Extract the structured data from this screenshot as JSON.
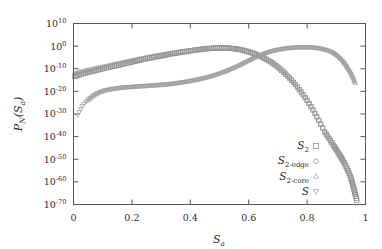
{
  "figure": {
    "background_color": "#ffffff",
    "frame_color": "#555555"
  },
  "chart_data": {
    "type": "scatter",
    "title": "",
    "xlabel": "S_a",
    "ylabel": "P_N(S_a)",
    "xlabel_base": "S",
    "xlabel_sub": "a",
    "ylabel_parts": {
      "p": "P",
      "n": "N",
      "open": "(",
      "s": "S",
      "a": "a",
      "close": ")"
    },
    "xlim": [
      0,
      1
    ],
    "ylim_log10": [
      -70,
      10
    ],
    "yscale": "log",
    "grid": false,
    "xticks": [
      0,
      0.2,
      0.4,
      0.6,
      0.8,
      1
    ],
    "xticklabels": [
      "0",
      "0.2",
      "0.4",
      "0.6",
      "0.8",
      "1"
    ],
    "yticks_log10": [
      10,
      0,
      -10,
      -20,
      -30,
      -40,
      -50,
      -60,
      -70
    ],
    "yticklabels": [
      "10^10",
      "10^0",
      "10^-10",
      "10^-20",
      "10^-30",
      "10^-40",
      "10^-50",
      "10^-60",
      "10^-70"
    ],
    "ytick_mantissa": "10",
    "ytick_exponents": [
      "10",
      "0",
      "-10",
      "-20",
      "-30",
      "-40",
      "-50",
      "-60",
      "-70"
    ],
    "legend_position": "lower-right-inside",
    "series": [
      {
        "name": "S_2",
        "legend_base": "S",
        "legend_sub": "2",
        "marker": "square",
        "color": "#8c8c8c",
        "x": [
          0.005,
          0.02,
          0.04,
          0.06,
          0.08,
          0.1,
          0.12,
          0.14,
          0.16,
          0.18,
          0.2,
          0.22,
          0.24,
          0.26,
          0.28,
          0.3,
          0.32,
          0.34,
          0.36,
          0.38,
          0.4,
          0.42,
          0.44,
          0.46,
          0.48,
          0.5,
          0.52,
          0.54,
          0.56,
          0.58,
          0.6,
          0.62,
          0.64,
          0.66,
          0.68,
          0.7,
          0.72,
          0.74,
          0.76,
          0.78,
          0.8,
          0.82,
          0.84,
          0.86,
          0.875,
          0.89,
          0.9,
          0.91,
          0.92,
          0.93,
          0.94,
          0.95,
          0.955,
          0.96,
          0.965,
          0.97
        ],
        "y_log10": [
          -13.4,
          -12.6,
          -11.9,
          -11.2,
          -10.6,
          -10.0,
          -9.4,
          -8.8,
          -8.2,
          -7.6,
          -7.0,
          -6.4,
          -5.8,
          -5.3,
          -4.8,
          -4.3,
          -3.8,
          -3.3,
          -2.9,
          -2.5,
          -2.1,
          -1.7,
          -1.4,
          -1.1,
          -0.9,
          -0.8,
          -0.8,
          -1.0,
          -1.3,
          -1.8,
          -2.5,
          -3.4,
          -4.5,
          -5.8,
          -7.4,
          -9.3,
          -11.5,
          -14.1,
          -17.0,
          -20.3,
          -24.0,
          -28.2,
          -32.8,
          -37.9,
          -40.8,
          -43.8,
          -45.8,
          -47.9,
          -50.0,
          -52.3,
          -55.0,
          -58.2,
          -60.5,
          -63.0,
          -65.5,
          -68.2
        ]
      },
      {
        "name": "S_2-edge",
        "legend_base": "S",
        "legend_sub": "2-edge",
        "marker": "circle",
        "color": "#9a9a9a",
        "x": [
          0.005,
          0.02,
          0.04,
          0.06,
          0.08,
          0.1,
          0.12,
          0.14,
          0.16,
          0.18,
          0.2,
          0.22,
          0.24,
          0.26,
          0.28,
          0.3,
          0.32,
          0.34,
          0.36,
          0.38,
          0.4,
          0.42,
          0.44,
          0.46,
          0.48,
          0.5,
          0.52,
          0.54,
          0.56,
          0.58,
          0.6,
          0.62,
          0.64,
          0.66,
          0.68,
          0.7,
          0.72,
          0.74,
          0.76,
          0.78,
          0.8,
          0.82,
          0.84,
          0.86,
          0.875,
          0.89,
          0.9,
          0.91,
          0.92,
          0.93,
          0.94,
          0.95,
          0.955,
          0.96,
          0.965
        ],
        "y_log10": [
          -12.2,
          -11.5,
          -10.9,
          -10.3,
          -9.7,
          -9.2,
          -8.6,
          -8.0,
          -7.5,
          -6.9,
          -6.4,
          -5.8,
          -5.3,
          -4.8,
          -4.3,
          -3.9,
          -3.4,
          -3.0,
          -2.6,
          -2.2,
          -1.9,
          -1.5,
          -1.2,
          -1.0,
          -0.8,
          -0.7,
          -0.7,
          -0.9,
          -1.2,
          -1.7,
          -2.4,
          -3.3,
          -4.4,
          -5.7,
          -7.3,
          -9.2,
          -11.4,
          -14.0,
          -16.9,
          -20.2,
          -23.9,
          -28.1,
          -32.7,
          -37.8,
          -40.7,
          -43.7,
          -45.7,
          -47.8,
          -49.9,
          -52.2,
          -54.9,
          -58.1,
          -60.4,
          -62.9,
          -65.4
        ]
      },
      {
        "name": "S_2-core",
        "legend_base": "S",
        "legend_sub": "2-core",
        "marker": "triangle-up",
        "color": "#a6a6a6",
        "x": [
          0.05,
          0.07,
          0.09,
          0.11,
          0.13,
          0.15,
          0.17,
          0.19,
          0.21,
          0.23,
          0.25,
          0.27,
          0.29,
          0.31,
          0.33,
          0.35,
          0.37,
          0.39,
          0.41,
          0.43,
          0.45,
          0.47,
          0.49,
          0.51,
          0.53,
          0.55,
          0.57,
          0.59,
          0.61,
          0.63,
          0.65,
          0.67,
          0.69,
          0.71,
          0.73,
          0.75,
          0.77,
          0.79,
          0.81,
          0.83,
          0.85,
          0.87,
          0.89,
          0.905,
          0.92,
          0.93,
          0.94,
          0.95,
          0.96,
          0.965
        ],
        "y_log10": [
          -24.0,
          -21.8,
          -20.4,
          -19.5,
          -19.0,
          -18.6,
          -18.3,
          -18.1,
          -17.9,
          -17.7,
          -17.6,
          -17.4,
          -17.2,
          -17.0,
          -16.7,
          -16.4,
          -16.0,
          -15.6,
          -15.1,
          -14.6,
          -14.0,
          -13.3,
          -12.5,
          -11.6,
          -10.6,
          -9.5,
          -8.3,
          -7.0,
          -5.7,
          -4.5,
          -3.4,
          -2.5,
          -1.8,
          -1.3,
          -0.9,
          -0.65,
          -0.5,
          -0.45,
          -0.5,
          -0.7,
          -1.1,
          -1.8,
          -3.0,
          -4.4,
          -6.3,
          -8.0,
          -10.0,
          -12.2,
          -14.8,
          -16.2
        ]
      },
      {
        "name": "S",
        "legend_base": "S",
        "legend_sub": "",
        "marker": "triangle-down",
        "color": "#9c9c9c",
        "x": [
          0.015,
          0.03,
          0.05,
          0.07,
          0.09,
          0.11,
          0.13,
          0.15,
          0.17,
          0.19,
          0.21,
          0.23,
          0.25,
          0.27,
          0.29,
          0.31,
          0.33,
          0.35,
          0.37,
          0.39,
          0.41,
          0.43,
          0.45,
          0.47,
          0.49,
          0.51,
          0.53,
          0.55,
          0.57,
          0.59,
          0.61,
          0.63,
          0.65,
          0.67,
          0.69,
          0.71,
          0.73,
          0.75,
          0.77,
          0.79,
          0.81,
          0.83,
          0.85,
          0.87,
          0.89,
          0.905,
          0.92,
          0.93,
          0.94,
          0.95,
          0.96
        ],
        "y_log10": [
          -30.5,
          -26.5,
          -23.6,
          -21.6,
          -20.3,
          -19.5,
          -19.0,
          -18.6,
          -18.3,
          -18.1,
          -17.9,
          -17.8,
          -17.6,
          -17.4,
          -17.2,
          -17.0,
          -16.8,
          -16.5,
          -16.1,
          -15.7,
          -15.2,
          -14.7,
          -14.1,
          -13.4,
          -12.6,
          -11.7,
          -10.7,
          -9.6,
          -8.4,
          -7.1,
          -5.8,
          -4.6,
          -3.5,
          -2.6,
          -1.9,
          -1.4,
          -1.0,
          -0.75,
          -0.6,
          -0.55,
          -0.6,
          -0.8,
          -1.2,
          -1.9,
          -3.1,
          -4.5,
          -6.4,
          -8.1,
          -10.1,
          -12.3,
          -14.9
        ]
      }
    ]
  }
}
